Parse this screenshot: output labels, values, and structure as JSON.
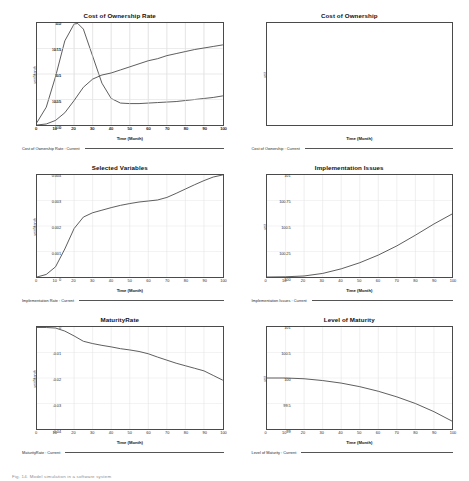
{
  "page": {
    "caption": "Fig. 14.  Model simulation in a software system"
  },
  "charts": [
    {
      "id": "cost-of-ownership-rate",
      "title": "Cost of Ownership Rate",
      "xlabel": "Time (Month)",
      "ylabel": "unit/Month",
      "legend": "Cost of Ownership Rate : Current",
      "yticks": [
        "0.2",
        "0.15",
        "0.1",
        "0.05",
        "0"
      ],
      "xticks": [
        "0",
        "10",
        "20",
        "30",
        "40",
        "50",
        "60",
        "70",
        "80",
        "90",
        "100"
      ],
      "chart_data": {
        "type": "line",
        "title": "Cost of Ownership Rate",
        "xlabel": "Time (Month)",
        "ylabel": "unit/Month",
        "xlim": [
          0,
          100
        ],
        "ylim": [
          0,
          0.2
        ],
        "grid": true,
        "legend_position": "below",
        "series": [
          {
            "name": "Cost of Ownership Rate : Current",
            "x": [
              0,
              5,
              10,
              15,
              20,
              22,
              25,
              30,
              35,
              40,
              45,
              50,
              55,
              60,
              65,
              70,
              75,
              80,
              85,
              90,
              95,
              100
            ],
            "y": [
              0.005,
              0.035,
              0.095,
              0.165,
              0.198,
              0.199,
              0.188,
              0.135,
              0.082,
              0.052,
              0.043,
              0.042,
              0.042,
              0.043,
              0.044,
              0.045,
              0.046,
              0.048,
              0.05,
              0.052,
              0.054,
              0.057
            ]
          }
        ]
      }
    },
    {
      "id": "cost-of-ownership",
      "title": "Cost of Ownership",
      "xlabel": "Time (Month)",
      "ylabel": "unit",
      "legend": "Cost of Ownership : Current",
      "yticks": [
        "110",
        "107.5",
        "105",
        "102.5",
        "100"
      ],
      "xticks": [
        "0",
        "10",
        "20",
        "30",
        "40",
        "50",
        "60",
        "70",
        "80",
        "90",
        "100"
      ],
      "chart_data": {
        "type": "line",
        "title": "Cost of Ownership",
        "xlabel": "Time (Month)",
        "ylabel": "unit",
        "xlim": [
          0,
          100
        ],
        "ylim": [
          100,
          110
        ],
        "grid": true,
        "legend_position": "below",
        "series": [
          {
            "name": "Cost of Ownership : Current",
            "x": [
              0,
              5,
              10,
              15,
              20,
              25,
              30,
              35,
              40,
              45,
              50,
              55,
              60,
              65,
              70,
              75,
              80,
              85,
              90,
              95,
              100
            ],
            "y": [
              100.0,
              100.1,
              100.45,
              101.2,
              102.4,
              103.7,
              104.5,
              104.9,
              105.1,
              105.4,
              105.7,
              106.0,
              106.3,
              106.5,
              106.8,
              107.0,
              107.2,
              107.4,
              107.55,
              107.7,
              107.85
            ]
          }
        ]
      }
    },
    {
      "id": "selected-variables",
      "title": "Selected Variables",
      "xlabel": "Time (Month)",
      "ylabel": "unit/Month",
      "legend": "Implementation Rate : Current",
      "yticks": [
        "0.004",
        "0.003",
        "0.002",
        "0.001",
        "0"
      ],
      "xticks": [
        "0",
        "10",
        "20",
        "30",
        "40",
        "50",
        "60",
        "70",
        "80",
        "90",
        "100"
      ],
      "chart_data": {
        "type": "line",
        "title": "Selected Variables",
        "xlabel": "Time (Month)",
        "ylabel": "unit/Month",
        "xlim": [
          0,
          100
        ],
        "ylim": [
          0,
          0.004
        ],
        "grid": true,
        "legend_position": "below",
        "series": [
          {
            "name": "Implementation Rate : Current",
            "x": [
              0,
              5,
              10,
              15,
              20,
              25,
              30,
              35,
              40,
              45,
              50,
              55,
              60,
              65,
              70,
              75,
              80,
              85,
              90,
              95,
              100
            ],
            "y": [
              0.0,
              0.0001,
              0.0004,
              0.0011,
              0.0019,
              0.00235,
              0.00252,
              0.00262,
              0.00272,
              0.00281,
              0.00288,
              0.00294,
              0.00298,
              0.00302,
              0.00312,
              0.00328,
              0.00345,
              0.00362,
              0.00378,
              0.00392,
              0.004
            ]
          }
        ]
      }
    },
    {
      "id": "implementation-issues",
      "title": "Implementation Issues",
      "xlabel": "Time (Month)",
      "ylabel": "unit",
      "legend": "Implementation Issues : Current",
      "yticks": [
        "101",
        "100.75",
        "100.5",
        "100.25",
        "100"
      ],
      "xticks": [
        "0",
        "10",
        "20",
        "30",
        "40",
        "50",
        "60",
        "70",
        "80",
        "90",
        "100"
      ],
      "chart_data": {
        "type": "line",
        "title": "Implementation Issues",
        "xlabel": "Time (Month)",
        "ylabel": "unit",
        "xlim": [
          0,
          100
        ],
        "ylim": [
          100,
          101
        ],
        "grid": true,
        "legend_position": "below",
        "series": [
          {
            "name": "Implementation Issues : Current",
            "x": [
              0,
              10,
              20,
              30,
              40,
              50,
              60,
              70,
              80,
              90,
              100
            ],
            "y": [
              100.0,
              100.002,
              100.01,
              100.035,
              100.08,
              100.14,
              100.215,
              100.305,
              100.41,
              100.52,
              100.62
            ]
          }
        ]
      }
    },
    {
      "id": "maturity-rate",
      "title": "MaturityRate",
      "xlabel": "Time (Month)",
      "ylabel": "unit/Month",
      "legend": "MaturityRate : Current",
      "yticks": [
        "0",
        "-0.01",
        "-0.02",
        "-0.03",
        "-0.04"
      ],
      "xticks": [
        "0",
        "10",
        "20",
        "30",
        "40",
        "50",
        "60",
        "70",
        "80",
        "90",
        "100"
      ],
      "chart_data": {
        "type": "line",
        "title": "MaturityRate",
        "xlabel": "Time (Month)",
        "ylabel": "unit/Month",
        "xlim": [
          0,
          100
        ],
        "ylim": [
          -0.04,
          0
        ],
        "grid": true,
        "legend_position": "below",
        "series": [
          {
            "name": "MaturityRate : Current",
            "x": [
              0,
              5,
              10,
              15,
              20,
              25,
              30,
              35,
              40,
              45,
              50,
              55,
              60,
              65,
              70,
              75,
              80,
              85,
              90,
              95,
              100
            ],
            "y": [
              -0.0002,
              -0.0002,
              -0.0004,
              -0.0016,
              -0.0035,
              -0.0056,
              -0.0065,
              -0.0072,
              -0.0078,
              -0.0085,
              -0.009,
              -0.0096,
              -0.0105,
              -0.0118,
              -0.013,
              -0.0142,
              -0.0152,
              -0.0162,
              -0.0172,
              -0.019,
              -0.0208
            ]
          }
        ]
      }
    },
    {
      "id": "level-of-maturity",
      "title": "Level of Maturity",
      "xlabel": "Time (Month)",
      "ylabel": "unit",
      "legend": "Level of Maturity : Current",
      "yticks": [
        "101",
        "100.5",
        "100",
        "99.5",
        "99"
      ],
      "xticks": [
        "0",
        "10",
        "20",
        "30",
        "40",
        "50",
        "60",
        "70",
        "80",
        "90",
        "100"
      ],
      "chart_data": {
        "type": "line",
        "title": "Level of Maturity",
        "xlabel": "Time (Month)",
        "ylabel": "unit",
        "xlim": [
          0,
          100
        ],
        "ylim": [
          99,
          101
        ],
        "grid": true,
        "legend_position": "below",
        "series": [
          {
            "name": "Level of Maturity : Current",
            "x": [
              0,
              10,
              20,
              30,
              40,
              50,
              60,
              70,
              80,
              90,
              100
            ],
            "y": [
              100.0,
              100.0,
              99.985,
              99.95,
              99.9,
              99.83,
              99.74,
              99.63,
              99.5,
              99.34,
              99.15
            ]
          }
        ]
      }
    }
  ]
}
